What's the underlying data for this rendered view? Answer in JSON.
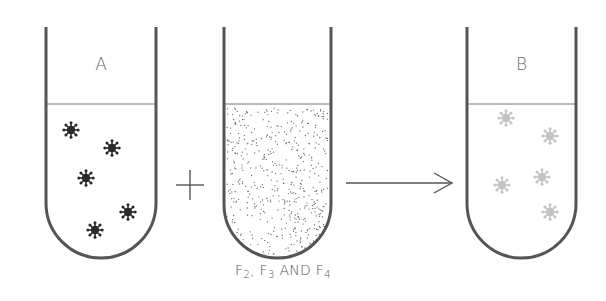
{
  "diagram": {
    "tubes": [
      {
        "id": "A",
        "label": "A",
        "x_left": 46,
        "x_right": 156,
        "top": 27,
        "liquid_y": 104,
        "bottom": 258,
        "contents": "active-virus",
        "virus_color": "#2a2a2a",
        "viruses": [
          [
            71,
            130
          ],
          [
            112,
            148
          ],
          [
            86,
            178
          ],
          [
            128,
            212
          ],
          [
            95,
            230
          ]
        ]
      },
      {
        "id": "reagent",
        "label": "",
        "x_left": 224,
        "x_right": 331,
        "top": 27,
        "liquid_y": 104,
        "bottom": 258,
        "contents": "stippled-fractions"
      },
      {
        "id": "B",
        "label": "B",
        "x_left": 467,
        "x_right": 576,
        "top": 27,
        "liquid_y": 104,
        "bottom": 258,
        "contents": "inactivated-virus",
        "virus_color": "#c4c4c4",
        "viruses": [
          [
            506,
            118
          ],
          [
            550,
            136
          ],
          [
            542,
            177
          ],
          [
            502,
            185
          ],
          [
            550,
            212
          ]
        ]
      }
    ],
    "operators": {
      "plus": {
        "symbol": "+",
        "x": 190,
        "y": 185
      },
      "arrow": {
        "symbol": "→",
        "x1": 346,
        "x2": 452,
        "y": 183
      }
    },
    "caption": {
      "parts": [
        {
          "text": "F",
          "sub": "2"
        },
        {
          "text": ", F",
          "sub": "3"
        },
        {
          "text": " AND F",
          "sub": "4"
        }
      ]
    },
    "colors": {
      "stroke": "#555555",
      "liquid_line": "#777777",
      "stipple": "#666666"
    }
  }
}
